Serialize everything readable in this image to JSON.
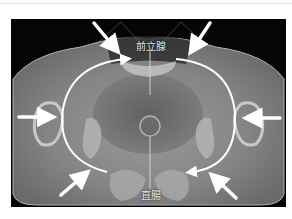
{
  "figure": {
    "type": "axial CT scan of pelvis",
    "labels": {
      "top": "前立腺",
      "bottom": "直腸"
    },
    "annotations": {
      "straight_arrows": [
        {
          "position": "upper-left",
          "direction": "down-right"
        },
        {
          "position": "upper-right",
          "direction": "down-left"
        },
        {
          "position": "left",
          "direction": "right"
        },
        {
          "position": "right",
          "direction": "left"
        },
        {
          "position": "lower-left",
          "direction": "up-right"
        },
        {
          "position": "lower-right",
          "direction": "up-left"
        }
      ],
      "curved_arrows": [
        {
          "side": "left",
          "from": "bottom",
          "to": "top"
        },
        {
          "side": "right",
          "from": "top",
          "to": "bottom"
        }
      ],
      "arrow_color": "#ffffff"
    },
    "colors": {
      "background": "#050505",
      "tissue": "#8a8a8a",
      "page": "#ffffff"
    }
  }
}
